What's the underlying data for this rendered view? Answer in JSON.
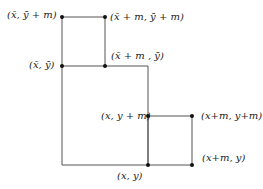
{
  "diagram": {
    "colors": {
      "line": "#555555",
      "dot": "#111111",
      "text": "#222222"
    },
    "polygon_big": [
      [
        62,
        17
      ],
      [
        105,
        17
      ],
      [
        105,
        66
      ],
      [
        148,
        66
      ],
      [
        148,
        165
      ],
      [
        62,
        165
      ]
    ],
    "small_square": [
      [
        148,
        116
      ],
      [
        192,
        116
      ],
      [
        192,
        165
      ],
      [
        148,
        165
      ]
    ],
    "extra_segments": [
      [
        [
          62,
          66
        ],
        [
          105,
          66
        ]
      ]
    ],
    "points": [
      {
        "id": "xbar-ybarm",
        "x": 62,
        "y": 17
      },
      {
        "id": "xbarm-ybarm",
        "x": 105,
        "y": 17
      },
      {
        "id": "xbar-ybar",
        "x": 62,
        "y": 66
      },
      {
        "id": "xbarm-ybar",
        "x": 105,
        "y": 66
      },
      {
        "id": "x-ym",
        "x": 148,
        "y": 116
      },
      {
        "id": "xm-ym",
        "x": 192,
        "y": 116
      },
      {
        "id": "x-y",
        "x": 148,
        "y": 165
      },
      {
        "id": "xm-y",
        "x": 192,
        "y": 165
      }
    ],
    "labels": {
      "xbar_ybar_plus_m": "(x̄, ȳ + m)",
      "xbar_plus_m_ybar_plus_m": "(x̄ + m, ȳ + m)",
      "xbar_ybar": "(x̄, ȳ)",
      "xbar_plus_m_ybar": "(x̄ + m , ȳ)",
      "x_y_plus_m": "(x, y + m)",
      "x_plus_m_y_plus_m": "(x+m, y+m)",
      "x_plus_m_y": "(x+m, y)",
      "x_y": "(x, y)"
    }
  }
}
